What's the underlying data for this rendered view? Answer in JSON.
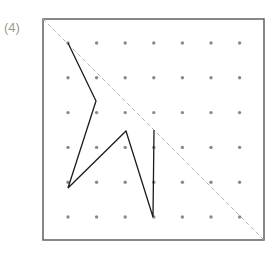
{
  "figure": {
    "label": "(4)",
    "type": "geoboard-dot-grid-figure",
    "caption_position": "top-left"
  },
  "frame": {
    "x": 43,
    "y": 19,
    "width": 221,
    "height": 221,
    "stroke_color": "#555555",
    "stroke_width": 1.4,
    "fill_color": "#ffffff"
  },
  "dot_grid": {
    "rows": 6,
    "cols": 7,
    "origin_x": 68,
    "origin_y": 43,
    "spacing_x": 28.6,
    "spacing_y": 34.8,
    "dot_radius": 1.7,
    "dot_color": "#8a8a8a"
  },
  "diagonal": {
    "name": "mirror-line",
    "x1": 43,
    "y1": 19,
    "x2": 264,
    "y2": 240,
    "stroke_color": "#b9b2b2",
    "stroke_width": 1,
    "dash": "4 3"
  },
  "polyline": {
    "name": "arrow-shape",
    "stroke_color": "#1b1b1b",
    "stroke_width": 1.3,
    "fill": "none",
    "points": [
      [
        68,
        43
      ],
      [
        96,
        101
      ],
      [
        68,
        188
      ],
      [
        126,
        131
      ],
      [
        153,
        217
      ],
      [
        154,
        130
      ]
    ],
    "point_labels": [
      "top-vertex",
      "upper-notch",
      "left-tip",
      "center-peak",
      "bottom-tip",
      "right-top"
    ]
  },
  "colors": {
    "frame": "#555555",
    "dot": "#8a8a8a",
    "dashed_line": "#b9b2b2",
    "shape_stroke": "#1b1b1b",
    "label_text": "#9a9a9a",
    "background": "#ffffff"
  }
}
